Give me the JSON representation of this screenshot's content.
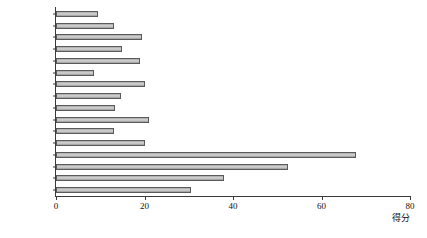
{
  "chart_data": {
    "type": "bar",
    "orientation": "horizontal",
    "title": "",
    "subtitle": "",
    "xlabel": "得分",
    "ylabel": "",
    "categories": [
      "通州区",
      "平谷区",
      "顺义区",
      "密云区",
      "怀柔区",
      "延庆区",
      "昌平区",
      "门头沟区",
      "房山区",
      "大兴区",
      "石景山区",
      "丰台区",
      "海淀区",
      "朝阳区",
      "西城区",
      "东城区"
    ],
    "values": [
      9.4,
      13,
      19.5,
      15,
      19,
      8.7,
      20,
      14.7,
      13.3,
      21,
      13.1,
      20,
      67.8,
      52.4,
      38,
      30.6
    ],
    "xlim": [
      0,
      80
    ],
    "xticks": [
      0,
      20,
      40,
      60,
      80
    ],
    "xtick_labels": [
      "0",
      "20",
      "40",
      "60",
      "80"
    ],
    "grid": false,
    "legend": null,
    "bar_face_color": "#c8c8c8",
    "bar_edge_color": "#5a5a5a",
    "axis_color": "#3a3a3a"
  }
}
